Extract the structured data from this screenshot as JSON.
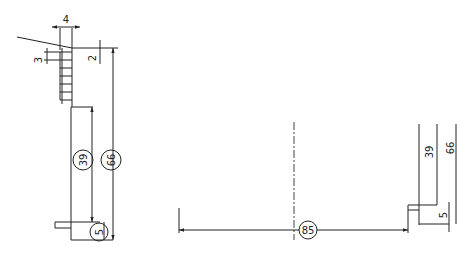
{
  "drawing": {
    "background": "#ffffff",
    "line_color": "#222222",
    "left_view": {
      "dims": {
        "width_top": "4",
        "pitch": "3",
        "offset": "2",
        "mid_height": "39",
        "total_height": "66",
        "bottom_step": "5"
      }
    },
    "right_view": {
      "dims": {
        "span": "85",
        "mid_height": "39",
        "total_height": "66",
        "bottom_step": "5"
      }
    }
  }
}
